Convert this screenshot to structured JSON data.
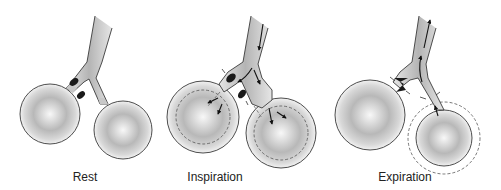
{
  "figure": {
    "type": "lung-alveoli-airway-diagram",
    "panels": [
      {
        "id": "rest",
        "label": "Rest"
      },
      {
        "id": "inspiration",
        "label": "Inspiration"
      },
      {
        "id": "expiration",
        "label": "Expiration"
      }
    ]
  },
  "colors": {
    "outline": "#3a3a3a",
    "airway_fill": "#c8c8c8",
    "alveolus_center": "#f4f4f4",
    "alveolus_edge": "#9a9a9a",
    "obstruction": "#1a1a1a",
    "arrow": "#111111"
  }
}
